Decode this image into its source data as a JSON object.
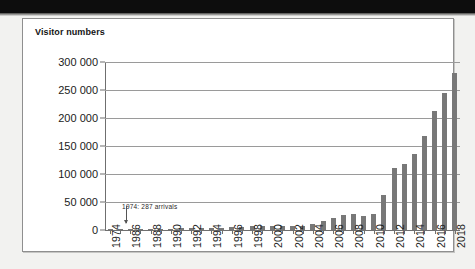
{
  "figure": {
    "title": "Visitor numbers"
  },
  "annotation": {
    "text": "1974: 287 arrivals",
    "target_category": "1974",
    "arrow": "down-arrow-icon"
  },
  "colors": {
    "bar": "#787878",
    "gridline": "#9a9a9a",
    "axis": "#6f6f6f",
    "panel_background": "#ffffff",
    "page_background": "#f2f2f0",
    "top_band": "#0d0d0d",
    "text": "#1b1b1b"
  },
  "chart_data": {
    "type": "bar",
    "title": "Visitor numbers",
    "xlabel": "",
    "ylabel": "Visitor numbers",
    "ylim": [
      0,
      300000
    ],
    "ytick_labels": [
      "300 000",
      "250 000",
      "200 000",
      "150 000",
      "100 000",
      "50 000",
      "0"
    ],
    "ytick_values": [
      300000,
      250000,
      200000,
      150000,
      100000,
      50000,
      0
    ],
    "grid": true,
    "legend": "none",
    "categories": [
      "1974",
      "1985",
      "1986",
      "1987",
      "1988",
      "1989",
      "1990",
      "1991",
      "1992",
      "1993",
      "1994",
      "1995",
      "1996",
      "1997",
      "1998",
      "1999",
      "2000",
      "2001",
      "2002",
      "2003",
      "2004",
      "2005",
      "2006",
      "2007",
      "2008",
      "2009",
      "2010",
      "2011",
      "2012",
      "2013",
      "2014",
      "2015",
      "2016",
      "2017",
      "2018"
    ],
    "tick_labels_shown": [
      "1974",
      "",
      "1986",
      "",
      "1988",
      "",
      "1990",
      "",
      "1992",
      "",
      "1994",
      "",
      "1996",
      "",
      "1998",
      "",
      "2000",
      "",
      "2002",
      "",
      "2004",
      "",
      "2006",
      "",
      "2008",
      "",
      "2010",
      "",
      "2012",
      "",
      "2014",
      "",
      "2016",
      "",
      "2018"
    ],
    "values": [
      287,
      1000,
      1500,
      1800,
      2000,
      2200,
      2500,
      2800,
      3000,
      3200,
      3500,
      4000,
      5500,
      6000,
      6500,
      7000,
      7500,
      6500,
      7000,
      8000,
      11000,
      16000,
      22000,
      26000,
      28000,
      25000,
      29000,
      62000,
      110000,
      118000,
      135000,
      167000,
      212000,
      245000,
      280000
    ]
  }
}
